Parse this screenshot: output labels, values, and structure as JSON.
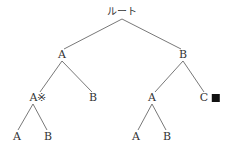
{
  "tree": {
    "root": {
      "label": "ルート"
    },
    "level1": [
      {
        "label": "A"
      },
      {
        "label": "B"
      }
    ],
    "level2": [
      {
        "label": "A※"
      },
      {
        "label": "B"
      },
      {
        "label": "A"
      },
      {
        "label": "C"
      }
    ],
    "level3": [
      {
        "label": "A"
      },
      {
        "label": "B"
      },
      {
        "label": "A"
      },
      {
        "label": "B"
      }
    ],
    "markers": {
      "c_node_marker": "black-square"
    }
  }
}
